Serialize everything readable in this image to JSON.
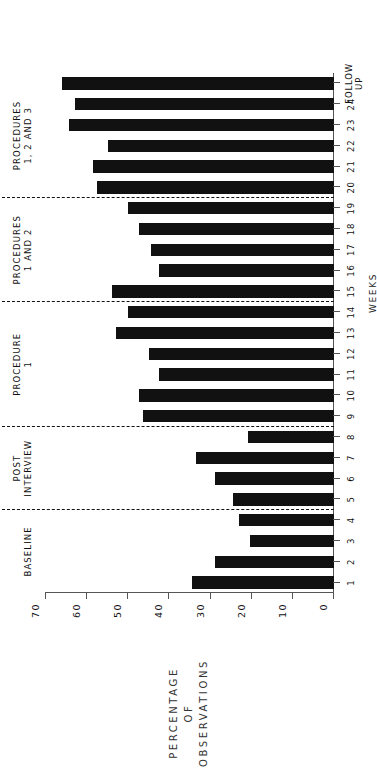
{
  "chart_data": {
    "type": "bar",
    "title": "",
    "xlabel": "WEEKS",
    "ylabel": "PERCENTAGE OF OBSERVATIONS",
    "ylabel_lines": [
      "PERCENTAGE",
      "OF",
      "OBSERVATIONS"
    ],
    "ylim": [
      0,
      70
    ],
    "ytick_values": [
      0,
      10,
      20,
      30,
      40,
      50,
      60,
      70
    ],
    "ytick_labels": [
      "0",
      "10",
      "20",
      "30",
      "40",
      "50",
      "60",
      "70"
    ],
    "grid": false,
    "legend": false,
    "bar_color": "#111111",
    "axis_color": "#555555",
    "categories": [
      "1",
      "2",
      "3",
      "4",
      "5",
      "6",
      "7",
      "8",
      "9",
      "10",
      "11",
      "12",
      "13",
      "14",
      "15",
      "16",
      "17",
      "18",
      "19",
      "20",
      "21",
      "22",
      "23",
      "24",
      "FOLLOW UP"
    ],
    "category_labels_two_line": {
      "25": [
        "FOLLOW",
        "UP"
      ]
    },
    "values": [
      34.5,
      29.0,
      20.5,
      23.0,
      24.5,
      29.0,
      33.5,
      21.0,
      46.5,
      47.5,
      42.5,
      45.0,
      53.0,
      50.0,
      54.0,
      42.5,
      44.5,
      47.5,
      50.0,
      57.5,
      58.5,
      55.0,
      64.5,
      63.0,
      66.0
    ],
    "phases": [
      {
        "label": "BASELINE",
        "label_lines": [
          "BASELINE"
        ],
        "from_index": 1,
        "to_index": 4
      },
      {
        "label": "POST INTERVIEW",
        "label_lines": [
          "POST",
          "INTERVIEW"
        ],
        "from_index": 5,
        "to_index": 8
      },
      {
        "label": "PROCEDURE 1",
        "label_lines": [
          "PROCEDURE",
          "1"
        ],
        "from_index": 9,
        "to_index": 14
      },
      {
        "label": "PROCEDURES 1 AND 2",
        "label_lines": [
          "PROCEDURES",
          "1 AND 2"
        ],
        "from_index": 15,
        "to_index": 19
      },
      {
        "label": "PROCEDURES 1, 2 AND 3",
        "label_lines": [
          "PROCEDURES",
          "1, 2 AND 3"
        ],
        "from_index": 20,
        "to_index": 25
      }
    ],
    "dividers_after_category": [
      4,
      8,
      14,
      19
    ],
    "orientation": "rotated-90-ccw"
  }
}
